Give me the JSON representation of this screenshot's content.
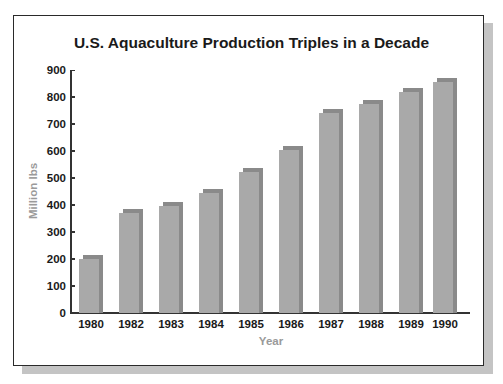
{
  "chart_data": {
    "type": "bar",
    "title": "U.S. Aquaculture Production Triples in a Decade",
    "xlabel": "Year",
    "ylabel": "Million lbs",
    "categories": [
      "1980",
      "1982",
      "1983",
      "1984",
      "1985",
      "1986",
      "1987",
      "1988",
      "1989",
      "1990"
    ],
    "values": [
      200,
      370,
      395,
      445,
      520,
      605,
      740,
      775,
      820,
      855
    ],
    "ylim": [
      0,
      900
    ],
    "yticks": [
      0,
      100,
      200,
      300,
      400,
      500,
      600,
      700,
      800,
      900
    ],
    "grid": false,
    "legend": null,
    "style": "3d-bars",
    "colors": {
      "bar_front": "#a9a9a9",
      "bar_side": "#8a8a8a"
    }
  },
  "labels": {
    "title": "U.S. Aquaculture Production Triples in a Decade",
    "xlabel": "Year",
    "ylabel": "Million lbs"
  }
}
